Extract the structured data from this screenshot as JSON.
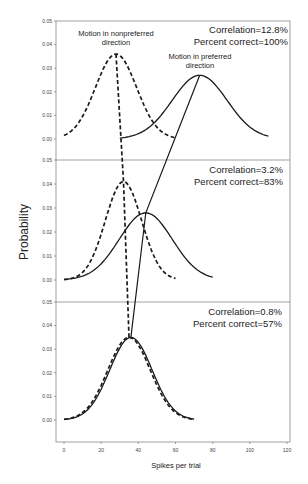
{
  "chart_data": {
    "type": "line",
    "xlabel": "Spikes per trial",
    "ylabel": "Probability",
    "xlim": [
      0,
      120
    ],
    "xticks": [
      0,
      20,
      40,
      60,
      80,
      100,
      120
    ],
    "ylim": [
      0,
      0.05
    ],
    "yticks": [
      "0.00",
      "0.01",
      "0.02",
      "0.03",
      "0.04",
      "0.05"
    ],
    "grid": false,
    "panels": [
      {
        "correlation_label": "Correlation=12.8%",
        "percent_label": "Percent correct=100%",
        "series": [
          {
            "name": "Motion in nonpreferred direction",
            "style": "dashed",
            "mean": 28,
            "peak": 0.036,
            "x_range": [
              0,
              60
            ]
          },
          {
            "name": "Motion in preferred direction",
            "style": "solid",
            "mean": 73,
            "peak": 0.027,
            "x_range": [
              30,
              110
            ]
          }
        ]
      },
      {
        "correlation_label": "Correlation=3.2%",
        "percent_label": "Percent correct=83%",
        "series": [
          {
            "name": "Motion in nonpreferred direction",
            "style": "dashed",
            "mean": 32,
            "peak": 0.041,
            "x_range": [
              0,
              60
            ]
          },
          {
            "name": "Motion in preferred direction",
            "style": "solid",
            "mean": 44,
            "peak": 0.028,
            "x_range": [
              0,
              80
            ]
          }
        ]
      },
      {
        "correlation_label": "Correlation=0.8%",
        "percent_label": "Percent correct=57%",
        "series": [
          {
            "name": "Motion in nonpreferred direction",
            "style": "dashed",
            "mean": 35,
            "peak": 0.035,
            "x_range": [
              0,
              70
            ]
          },
          {
            "name": "Motion in preferred direction",
            "style": "solid",
            "mean": 36,
            "peak": 0.035,
            "x_range": [
              0,
              70
            ]
          }
        ]
      }
    ],
    "annotations": [
      {
        "text_line1": "Motion in nonpreferred",
        "text_line2": "direction",
        "panel": 0
      },
      {
        "text_line1": "Motion in preferred",
        "text_line2": "direction",
        "panel": 0
      }
    ]
  },
  "labels": {
    "nonpref_1": "Motion in nonpreferred",
    "nonpref_2": "direction",
    "pref_1": "Motion in preferred",
    "pref_2": "direction",
    "p0_corr": "Correlation=12.8%",
    "p0_pct": "Percent correct=100%",
    "p1_corr": "Correlation=3.2%",
    "p1_pct": "Percent correct=83%",
    "p2_corr": "Correlation=0.8%",
    "p2_pct": "Percent correct=57%",
    "xlabel": "Spikes per trial",
    "ylabel": "Probability"
  }
}
